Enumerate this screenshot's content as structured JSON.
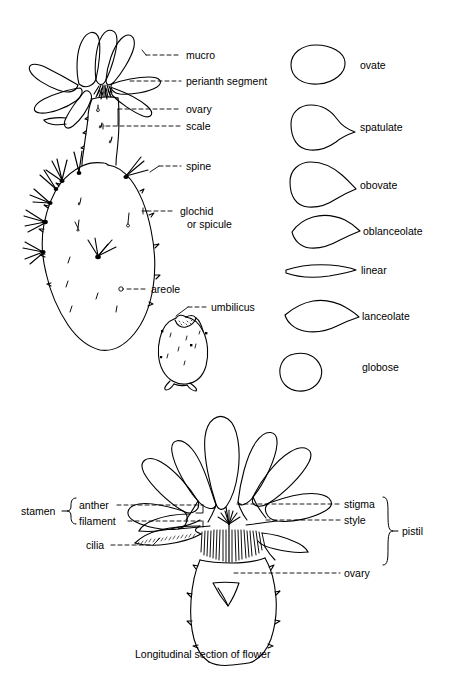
{
  "figure": {
    "type": "botanical-line-diagram",
    "background_color": "#ffffff",
    "ink_color": "#000000"
  },
  "top_figure": {
    "name": "cactus-flower-and-stem",
    "labels": [
      {
        "id": "mucro",
        "text": "mucro"
      },
      {
        "id": "perianth-segment",
        "text": "perianth segment"
      },
      {
        "id": "ovary",
        "text": "ovary"
      },
      {
        "id": "scale",
        "text": "scale"
      },
      {
        "id": "spine",
        "text": "spine"
      },
      {
        "id": "glochid",
        "text": "glochid",
        "text_line2": "or spicule"
      },
      {
        "id": "areole",
        "text": "areole"
      },
      {
        "id": "umbilicus",
        "text": "umbilicus"
      }
    ]
  },
  "shape_chart": {
    "name": "perianth-segment-shapes",
    "items": [
      {
        "id": "ovate",
        "label": "ovate"
      },
      {
        "id": "spatulate",
        "label": "spatulate"
      },
      {
        "id": "obovate",
        "label": "obovate"
      },
      {
        "id": "oblanceolate",
        "label": "oblanceolate"
      },
      {
        "id": "linear",
        "label": "linear"
      },
      {
        "id": "lanceolate",
        "label": "lanceolate"
      },
      {
        "id": "globose",
        "label": "globose"
      }
    ]
  },
  "bottom_figure": {
    "name": "longitudinal-section-of-flower",
    "caption": "Longitudinal section of flower",
    "brackets": [
      {
        "id": "stamen",
        "label": "stamen",
        "members": [
          "anther",
          "filament"
        ]
      },
      {
        "id": "pistil",
        "label": "pistil",
        "members": [
          "stigma",
          "style",
          "ovary"
        ]
      }
    ],
    "labels": [
      {
        "id": "stamen",
        "text": "stamen"
      },
      {
        "id": "anther",
        "text": "anther"
      },
      {
        "id": "filament",
        "text": "filament"
      },
      {
        "id": "cilia",
        "text": "cilia"
      },
      {
        "id": "stigma",
        "text": "stigma"
      },
      {
        "id": "style",
        "text": "style"
      },
      {
        "id": "pistil",
        "text": "pistil"
      },
      {
        "id": "ovary",
        "text": "ovary"
      }
    ]
  }
}
